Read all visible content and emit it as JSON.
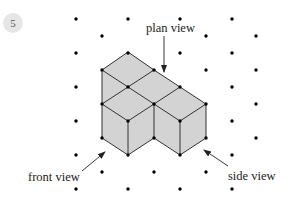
{
  "question_number": "5",
  "labels": {
    "plan": "plan view",
    "front": "front view",
    "side": "side view"
  },
  "colors": {
    "face": "#d3d3d3",
    "edge": "#333333",
    "dot": "#000000"
  },
  "grid": {
    "odd_columns_x": [
      76,
      128,
      180,
      232
    ],
    "odd_rows_y": [
      19,
      53,
      87,
      121,
      155,
      189
    ],
    "even_columns_x": [
      102,
      154,
      206,
      256
    ],
    "even_rows_y": [
      36,
      70,
      104,
      138,
      172
    ]
  }
}
